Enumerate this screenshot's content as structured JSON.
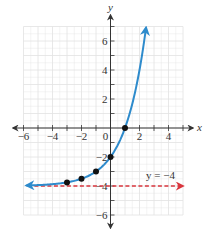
{
  "chart_data": {
    "type": "line",
    "title": "",
    "xlabel": "x",
    "ylabel": "y",
    "xlim": [
      -6,
      5
    ],
    "ylim": [
      -6,
      7
    ],
    "grid": true,
    "x_ticks": [
      -6,
      -4,
      -2,
      0,
      2,
      4
    ],
    "y_ticks": [
      6,
      4,
      2,
      -2,
      -4,
      -6
    ],
    "x_tick_labels": [
      "−6",
      "−4",
      "−2",
      "0",
      "2",
      "4"
    ],
    "y_tick_labels": [
      "6",
      "4",
      "2",
      "−2",
      "−4",
      "−6"
    ],
    "series": [
      {
        "name": "exponential curve",
        "function": "2^(x+1) - 4",
        "color": "#2e8bcc",
        "style": "solid",
        "arrows": "both",
        "x_range": [
          -5.8,
          2.45
        ],
        "points": [
          {
            "x": -3,
            "y": -3.75
          },
          {
            "x": -2,
            "y": -3.5
          },
          {
            "x": -1,
            "y": -3
          },
          {
            "x": 0,
            "y": -2
          },
          {
            "x": 1,
            "y": 0
          }
        ]
      },
      {
        "name": "horizontal asymptote",
        "label": "y = −4",
        "color": "#d9363e",
        "style": "dashed",
        "y": -4,
        "x_range": [
          -5.8,
          5
        ]
      }
    ],
    "annotations": [
      {
        "text": "y = −4",
        "x": 3.3,
        "y": -3.6
      }
    ]
  }
}
